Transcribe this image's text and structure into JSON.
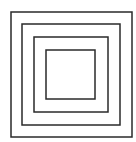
{
  "diagram": {
    "type": "concentric-squares",
    "stroke_color": "#2a2a2a",
    "background": "#ffffff",
    "squares": [
      {
        "name": "outer",
        "x": 11,
        "y": 12,
        "w": 121,
        "h": 125
      },
      {
        "name": "second",
        "x": 22,
        "y": 24,
        "w": 98,
        "h": 101
      },
      {
        "name": "third",
        "x": 34,
        "y": 37,
        "w": 74,
        "h": 75
      },
      {
        "name": "inner",
        "x": 46,
        "y": 50,
        "w": 49,
        "h": 49
      }
    ]
  }
}
